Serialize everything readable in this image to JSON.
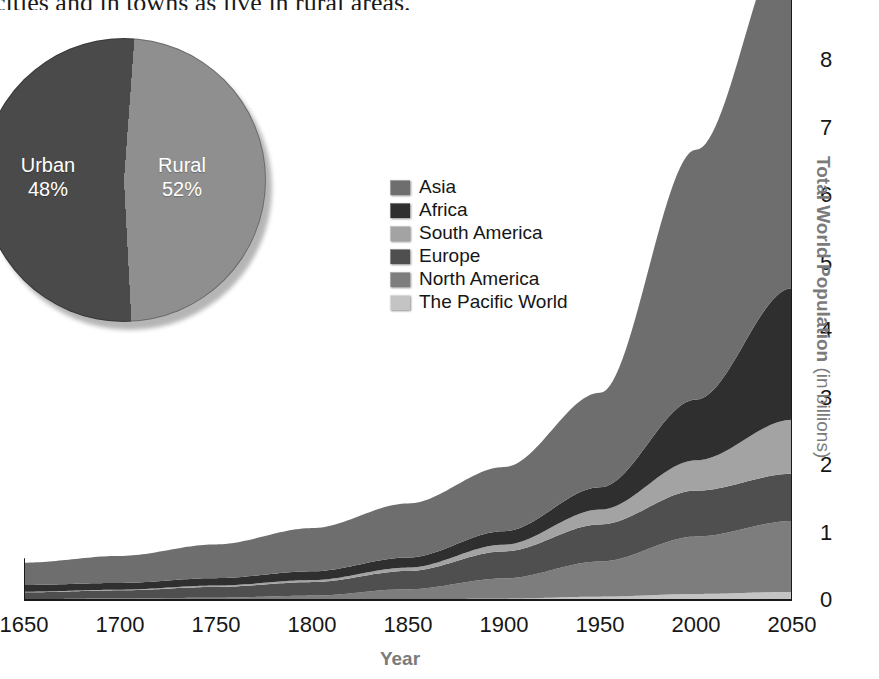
{
  "page": {
    "body_text_fragment": "cities and in towns as live in rural areas."
  },
  "pie": {
    "name": "urban-rural-split",
    "slices": [
      {
        "label": "Urban",
        "percent_label": "48%",
        "value": 48,
        "color": "#8f8f8f"
      },
      {
        "label": "Rural",
        "percent_label": "52%",
        "value": 52,
        "color": "#4a4a4a"
      }
    ]
  },
  "legend": {
    "items": [
      {
        "label": "Asia",
        "color": "#6e6e6e"
      },
      {
        "label": "Africa",
        "color": "#2f2f2f"
      },
      {
        "label": "South America",
        "color": "#a3a3a3"
      },
      {
        "label": "Europe",
        "color": "#4f4f4f"
      },
      {
        "label": "North America",
        "color": "#7d7d7d"
      },
      {
        "label": "The Pacific World",
        "color": "#c4c4c4"
      }
    ]
  },
  "axes": {
    "y_title_main": "Total World Population",
    "y_title_unit": " (in billions)",
    "y_ticks": [
      "0",
      "1",
      "2",
      "3",
      "4",
      "5",
      "6",
      "7",
      "8"
    ],
    "x_title": "Year",
    "x_ticks": [
      "1650",
      "1700",
      "1750",
      "1800",
      "1850",
      "1900",
      "1950",
      "2000",
      "2050"
    ]
  },
  "chart_data": {
    "type": "area",
    "title": "",
    "subtitle": "",
    "xlabel": "Year",
    "ylabel": "Total World Population (in billions)",
    "xlim": [
      1650,
      2050
    ],
    "ylim": [
      0,
      8.6
    ],
    "grid": false,
    "stacked": true,
    "legend_position": "inside-upper-left",
    "x": [
      1650,
      1700,
      1750,
      1800,
      1850,
      1900,
      1950,
      2000,
      2050
    ],
    "series": [
      {
        "name": "The Pacific World",
        "color": "#c4c4c4",
        "values": [
          0.003,
          0.003,
          0.004,
          0.005,
          0.01,
          0.02,
          0.05,
          0.09,
          0.12
        ]
      },
      {
        "name": "North America",
        "color": "#7d7d7d",
        "values": [
          0.01,
          0.02,
          0.03,
          0.06,
          0.15,
          0.3,
          0.52,
          0.85,
          1.05
        ]
      },
      {
        "name": "Europe",
        "color": "#4f4f4f",
        "values": [
          0.1,
          0.12,
          0.16,
          0.2,
          0.27,
          0.4,
          0.55,
          0.68,
          0.7
        ]
      },
      {
        "name": "South America",
        "color": "#a3a3a3",
        "values": [
          0.01,
          0.01,
          0.02,
          0.03,
          0.05,
          0.1,
          0.22,
          0.45,
          0.8
        ]
      },
      {
        "name": "Africa",
        "color": "#2f2f2f",
        "values": [
          0.1,
          0.1,
          0.11,
          0.13,
          0.15,
          0.2,
          0.33,
          0.9,
          1.95
        ]
      },
      {
        "name": "Asia",
        "color": "#6e6e6e",
        "values": [
          0.33,
          0.4,
          0.5,
          0.64,
          0.8,
          0.95,
          1.4,
          3.7,
          5.3
        ]
      }
    ],
    "totals": [
      0.553,
      0.653,
      0.824,
      1.065,
      1.43,
      1.97,
      3.07,
      6.67,
      9.92
    ],
    "legend_order": [
      "Asia",
      "Africa",
      "South America",
      "Europe",
      "North America",
      "The Pacific World"
    ]
  }
}
